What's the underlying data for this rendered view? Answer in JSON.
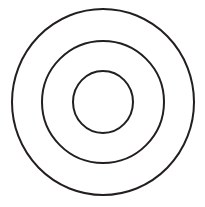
{
  "figure": {
    "background_color": "#ffffff",
    "stroke_color": "#231f20",
    "fill": "none",
    "canvas": {
      "width": 205,
      "height": 207
    },
    "center": {
      "x": 103,
      "y": 102
    },
    "shape_count": 3,
    "shapes": [
      {
        "name": "outer-circle",
        "label": "Outer circle",
        "cx": 103,
        "cy": 102,
        "rx": 91,
        "ry": 93,
        "stroke_width": 2,
        "stroke_color": "#231f20",
        "fill": "none"
      },
      {
        "name": "middle-circle",
        "label": "Middle circle",
        "cx": 103,
        "cy": 102,
        "rx": 61,
        "ry": 61,
        "stroke_width": 2,
        "stroke_color": "#231f20",
        "fill": "none"
      },
      {
        "name": "inner-circle",
        "label": "Inner circle",
        "cx": 103,
        "cy": 102,
        "rx": 30,
        "ry": 31,
        "stroke_width": 2,
        "stroke_color": "#231f20",
        "fill": "none"
      }
    ]
  }
}
